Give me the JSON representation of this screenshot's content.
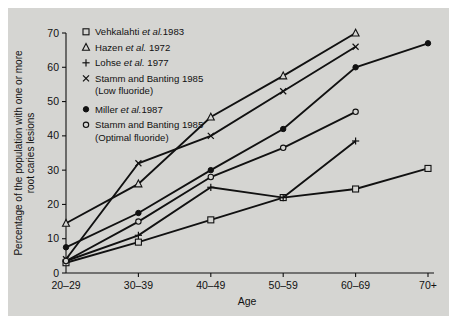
{
  "figure": {
    "background_color": "#d5d5d2",
    "line_color": "#111111"
  },
  "chart_data": {
    "type": "line",
    "title": "",
    "xlabel": "Age",
    "ylabel": "Percentage of the population with one or more root caries lesions",
    "categories": [
      "20-29",
      "30-39",
      "40-49",
      "50-59",
      "60-69",
      "70+"
    ],
    "xticklabels": [
      "20–29",
      "30–39",
      "40–49",
      "50–59",
      "60–69",
      "70+"
    ],
    "yticklabels": [
      "0",
      "10",
      "20",
      "30",
      "40",
      "50",
      "60",
      "70"
    ],
    "yticks": [
      0,
      10,
      20,
      30,
      40,
      50,
      60,
      70
    ],
    "ylim": [
      0,
      70
    ],
    "grid": false,
    "legend_position": "upper-left-inside",
    "series": [
      {
        "name": "Vehkalahti et al.1983",
        "label_main": "Vehkalahti",
        "label_ital": "et al.",
        "label_tail": "1983",
        "marker": "open-square",
        "x": [
          "20-29",
          "30-39",
          "40-49",
          "50-59",
          "60-69",
          "70+"
        ],
        "values": [
          3,
          9,
          15.5,
          22,
          24.5,
          30.5
        ]
      },
      {
        "name": "Hazen et al. 1972",
        "label_main": "Hazen",
        "label_ital": "et al.",
        "label_tail": "1972",
        "marker": "open-triangle",
        "x": [
          "20-29",
          "30-39",
          "40-49",
          "50-59",
          "60-69"
        ],
        "values": [
          14.5,
          26,
          45.5,
          57.5,
          70
        ]
      },
      {
        "name": "Lohse et al. 1977",
        "label_main": "Lohse",
        "label_ital": "et al.",
        "label_tail": "1977",
        "marker": "plus",
        "x": [
          "20-29",
          "30-39",
          "40-49",
          "50-59",
          "60-69"
        ],
        "values": [
          3.5,
          11,
          25,
          22,
          38.5
        ]
      },
      {
        "name": "Stamm and Banting 1985 (Low fluoride)",
        "label_main": "Stamm and Banting 1985",
        "label_sub": "(Low fluoride)",
        "marker": "cross",
        "x": [
          "20-29",
          "30-39",
          "40-49",
          "50-59",
          "60-69"
        ],
        "values": [
          4,
          32,
          40,
          53,
          66
        ]
      },
      {
        "name": "Miller et al.1987",
        "label_main": "Miller",
        "label_ital": "et al.",
        "label_tail": "1987",
        "marker": "filled-circle",
        "x": [
          "20-29",
          "30-39",
          "40-49",
          "50-59",
          "60-69",
          "70+"
        ],
        "values": [
          7.5,
          17.5,
          30,
          42,
          60,
          67
        ]
      },
      {
        "name": "Stamm and Banting 1985 (Optimal fluoride)",
        "label_main": "Stamm and Banting 1985",
        "label_sub": "(Optimal fluoride)",
        "marker": "open-circle",
        "x": [
          "20-29",
          "30-39",
          "40-49",
          "50-59",
          "60-69"
        ],
        "values": [
          3.5,
          15,
          28,
          36.5,
          47
        ]
      }
    ]
  },
  "legend": {
    "items": [
      {
        "marker": "open-square",
        "text": "Vehkalahti et al.1983",
        "pre": "Vehkalahti ",
        "ital": "et al.",
        "post": "1983"
      },
      {
        "marker": "open-triangle",
        "text": "Hazen et al. 1972",
        "pre": "Hazen ",
        "ital": "et al.",
        "post": " 1972"
      },
      {
        "marker": "plus",
        "text": "Lohse et al. 1977",
        "pre": "Lohse ",
        "ital": "et al.",
        "post": " 1977"
      },
      {
        "marker": "cross",
        "text": "Stamm and Banting 1985",
        "sub": "(Low fluoride)"
      },
      {
        "marker": "filled-circle",
        "text": "Miller et al.1987",
        "pre": "Miller ",
        "ital": "et al.",
        "post": "1987"
      },
      {
        "marker": "open-circle",
        "text": "Stamm and Banting 1985",
        "sub": "(Optimal fluoride)"
      }
    ]
  },
  "axes": {
    "x_title": "Age",
    "y_title_line1": "Percentage of the population with one or more",
    "y_title_line2": "root caries lesions"
  }
}
